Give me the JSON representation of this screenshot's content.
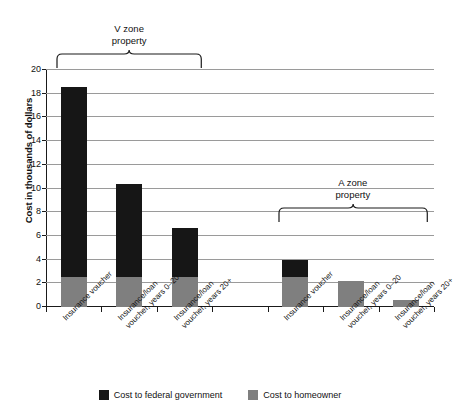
{
  "chart_data": {
    "type": "bar",
    "title": "",
    "subtitle": "",
    "xlabel": "",
    "ylabel": "Cost in thousands of dollars",
    "ylim": [
      0,
      20
    ],
    "yticks": [
      0,
      2,
      4,
      6,
      8,
      10,
      12,
      14,
      16,
      18,
      20
    ],
    "grid": true,
    "stacked": true,
    "legend_position": "bottom",
    "categories": [
      "Insurance voucher",
      "Insurance/loan voucher, years 0–20",
      "Insurance/loan voucher, years 20+",
      "Insurance voucher",
      "Insurance/loan voucher, years 0–20",
      "Insurance/loan voucher, years 20+"
    ],
    "series": [
      {
        "name": "Cost to federal government",
        "color": "#161616",
        "values": [
          16.1,
          7.9,
          4.2,
          1.5,
          0,
          0
        ]
      },
      {
        "name": "Cost to homeowner",
        "color": "#7f7f7f",
        "values": [
          2.5,
          2.5,
          2.5,
          2.5,
          2.2,
          0.55
        ]
      }
    ],
    "totals": [
      18.6,
      10.4,
      6.7,
      4.0,
      2.2,
      0.55
    ],
    "groups": [
      {
        "label_line1": "V zone",
        "label_line2": "property",
        "category_indices": [
          0,
          1,
          2
        ]
      },
      {
        "label_line1": "A zone",
        "label_line2": "property",
        "category_indices": [
          3,
          4,
          5
        ]
      }
    ],
    "annotations": [
      {
        "text": "V zone property",
        "kind": "brace-group"
      },
      {
        "text": "A zone property",
        "kind": "brace-group"
      }
    ]
  },
  "axis": {
    "y_title": "Cost in thousands of dollars",
    "y_tick_labels": [
      "20",
      "18",
      "16",
      "14",
      "12",
      "10",
      "8",
      "6",
      "4",
      "2",
      "0"
    ]
  },
  "groups": {
    "v_zone": {
      "line1": "V zone",
      "line2": "property"
    },
    "a_zone": {
      "line1": "A zone",
      "line2": "property"
    }
  },
  "categories": {
    "c0_line1": "Insurance voucher",
    "c0_line2": "",
    "c1_line1": "Insurance/loan",
    "c1_line2": "voucher, years 0–20",
    "c2_line1": "Insurance/loan",
    "c2_line2": "voucher, years 20+",
    "c3_line1": "Insurance voucher",
    "c3_line2": "",
    "c4_line1": "Insurance/loan",
    "c4_line2": "voucher, years 0–20",
    "c5_line1": "Insurance/loan",
    "c5_line2": "voucher, years 20+"
  },
  "legend": {
    "items": [
      {
        "label": "Cost to federal government",
        "color": "#161616"
      },
      {
        "label": "Cost to homeowner",
        "color": "#7f7f7f"
      }
    ]
  },
  "colors": {
    "government": "#161616",
    "homeowner": "#7f7f7f",
    "gridline": "#9a9a9a",
    "axis": "#1a1a1a"
  }
}
